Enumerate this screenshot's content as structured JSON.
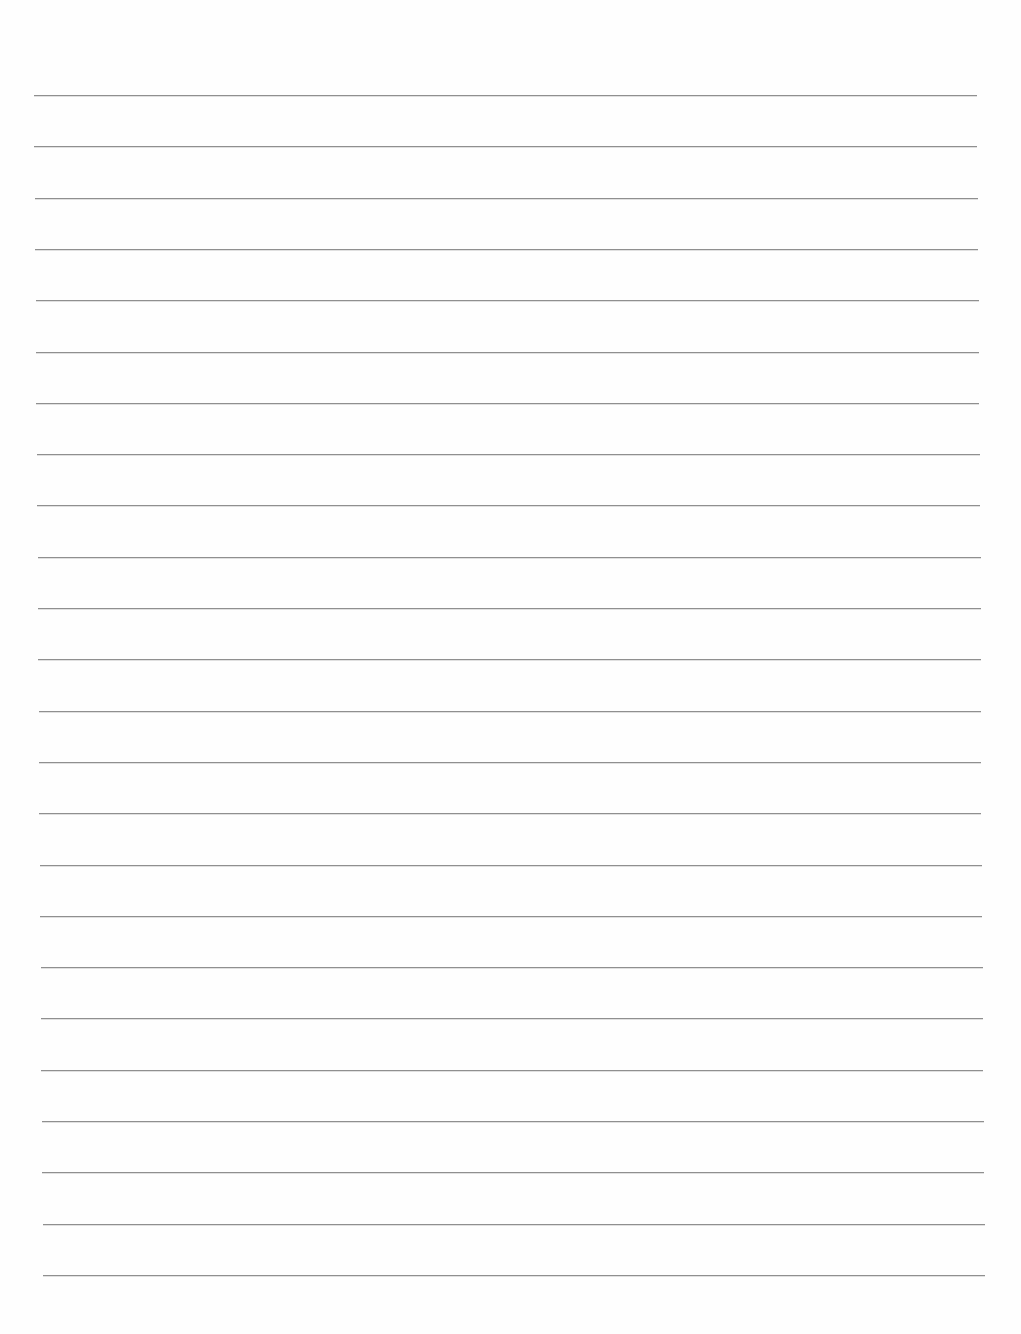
{
  "page": {
    "type": "lined-paper",
    "background_color": "#fefefe",
    "line_color": "#8f8f8f",
    "line_count": 24,
    "first_line_y": 95,
    "line_spacing": 51.3,
    "top_line_x": [
      34,
      977
    ],
    "bottom_line_x": [
      43,
      985
    ],
    "text": []
  }
}
